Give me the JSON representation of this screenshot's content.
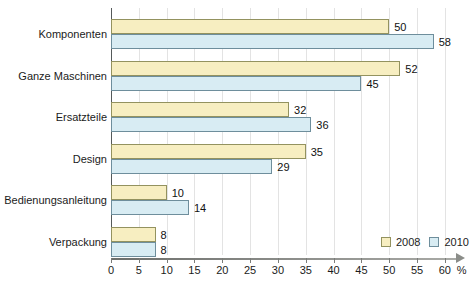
{
  "chart_data": {
    "type": "bar",
    "orientation": "horizontal",
    "title": "",
    "xlabel": "%",
    "ylabel": "",
    "xlim": [
      0,
      62
    ],
    "grid": true,
    "legend_position": "bottom-right",
    "categories": [
      "Komponenten",
      "Ganze Maschinen",
      "Ersatzteile",
      "Design",
      "Bedienungsanleitung",
      "Verpackung"
    ],
    "series": [
      {
        "name": "2008",
        "color": "#f7eec1",
        "values": [
          50,
          52,
          32,
          35,
          10,
          8
        ]
      },
      {
        "name": "2010",
        "color": "#d8ecf3",
        "values": [
          58,
          45,
          36,
          29,
          14,
          8
        ]
      }
    ],
    "xticks": [
      0,
      5,
      10,
      15,
      20,
      25,
      30,
      35,
      40,
      45,
      50,
      55,
      60
    ],
    "xtick_labels": [
      "0",
      "5",
      "10",
      "15",
      "20",
      "25",
      "30",
      "35",
      "40",
      "45",
      "50",
      "55",
      "60"
    ],
    "axis_unit": "%"
  },
  "legend": {
    "items": [
      {
        "label": "2008"
      },
      {
        "label": "2010"
      }
    ]
  }
}
